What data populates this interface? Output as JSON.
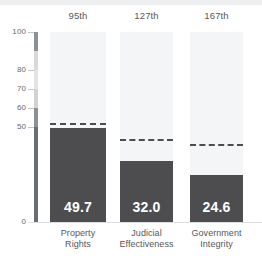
{
  "chart_data": {
    "type": "bar",
    "title": "",
    "subtitle": "",
    "xlabel": "",
    "ylabel": "",
    "ylim": [
      0,
      100
    ],
    "grid": false,
    "legend": "none",
    "categories": [
      "Property Rights",
      "Judicial Effectiveness",
      "Government Integrity"
    ],
    "category_lines": [
      [
        "Property",
        "Rights"
      ],
      [
        "Judicial",
        "Effectiveness"
      ],
      [
        "Government",
        "Integrity"
      ]
    ],
    "values": [
      49.7,
      32.0,
      24.6
    ],
    "value_labels": [
      "49.7",
      "32.0",
      "24.6"
    ],
    "rank_labels": [
      "95th",
      "127th",
      "167th"
    ],
    "reference_values": [
      52.0,
      43.5,
      41.0
    ],
    "reference_style": "dashed",
    "y_ticks": [
      100,
      80,
      70,
      60,
      50,
      0
    ],
    "y_tick_labels": [
      "100",
      "80",
      "70",
      "60",
      "50",
      "0"
    ],
    "colors": {
      "bar": "#4d4d4f",
      "column_background": "#f4f5f6",
      "reference_line": "#4d4d4f",
      "value_text": "#ffffff",
      "axis_text": "#66696d",
      "category_text": "#55585c",
      "rank_text": "#55585c",
      "page_background": "#ffffff",
      "top_strip": "#eceef0"
    },
    "axis_scale_segments": [
      {
        "from": 100,
        "to": 90,
        "color": "#8e9194"
      },
      {
        "from": 90,
        "to": 80,
        "color": "#d7d9db"
      },
      {
        "from": 80,
        "to": 70,
        "color": "#e2e4e5"
      },
      {
        "from": 70,
        "to": 60,
        "color": "#d0d2d4"
      },
      {
        "from": 60,
        "to": 50,
        "color": "#8e9194"
      },
      {
        "from": 50,
        "to": 0,
        "color": "#6b6e71"
      }
    ]
  }
}
